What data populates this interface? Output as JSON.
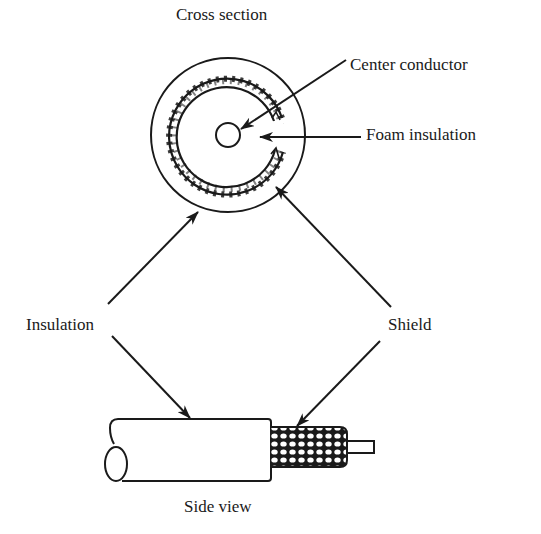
{
  "diagram": {
    "colors": {
      "ink": "#1a1a1a",
      "background": "#ffffff"
    },
    "views": {
      "cross_section": {
        "title": "Cross section"
      },
      "side_view": {
        "title": "Side view"
      }
    },
    "labels": {
      "center_conductor": "Center conductor",
      "foam_insulation": "Foam insulation",
      "insulation": "Insulation",
      "shield": "Shield"
    }
  }
}
